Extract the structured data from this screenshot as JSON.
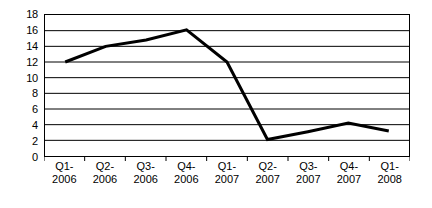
{
  "chart_data": {
    "type": "line",
    "title": "",
    "subtitle": "",
    "xlabel": "",
    "ylabel": "",
    "categories": [
      "Q1-2006",
      "Q2-2006",
      "Q3-2006",
      "Q4-2006",
      "Q1-2007",
      "Q2-2007",
      "Q3-2007",
      "Q4-2007",
      "Q1-2008"
    ],
    "category_lines": [
      [
        "Q1-",
        "2006"
      ],
      [
        "Q2-",
        "2006"
      ],
      [
        "Q3-",
        "2006"
      ],
      [
        "Q4-",
        "2006"
      ],
      [
        "Q1-",
        "2007"
      ],
      [
        "Q2-",
        "2007"
      ],
      [
        "Q3-",
        "2007"
      ],
      [
        "Q4-",
        "2007"
      ],
      [
        "Q1-",
        "2008"
      ]
    ],
    "values": [
      12,
      14,
      14.8,
      16.1,
      12,
      2.1,
      3.1,
      4.2,
      3.2
    ],
    "series": [
      {
        "name": "",
        "values": [
          12,
          14,
          14.8,
          16.1,
          12,
          2.1,
          3.1,
          4.2,
          3.2
        ],
        "color": "#000000",
        "line_width": 3,
        "markers": false
      }
    ],
    "ylim": [
      0,
      18
    ],
    "ytick_step": 2,
    "yticks": [
      0,
      2,
      4,
      6,
      8,
      10,
      12,
      14,
      16,
      18
    ],
    "ytick_labels": [
      "0",
      "2",
      "4",
      "6",
      "8",
      "10",
      "12",
      "14",
      "16",
      "18"
    ],
    "grid": {
      "horizontal": true,
      "vertical": false,
      "color": "#000000"
    },
    "legend": {
      "visible": false,
      "position": "none",
      "entries": []
    },
    "plot_background": "#FFFFFF",
    "frame_color": "#000000",
    "annotations": []
  }
}
